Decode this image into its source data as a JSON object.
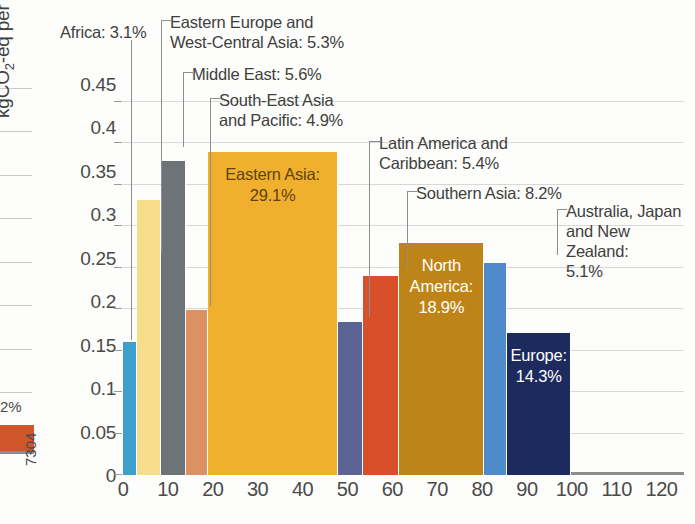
{
  "chart_data": {
    "type": "bar",
    "title": "",
    "subtitle": "",
    "xlabel": "",
    "ylabel": "kgCO2-eq per USD GDPPPP",
    "ylabel_parts": {
      "prefix": "kgCO",
      "sub": "2",
      "mid": "-eq per USD GDP",
      "sup": "PPP"
    },
    "xlim": [
      0,
      125
    ],
    "ylim": [
      0,
      0.47
    ],
    "grid": true,
    "legend_position": "none",
    "note": "Marimekko-style variable-width bars: bar width = share of world population (%), bar height = emissions intensity",
    "yticks": [
      "0",
      "0.05",
      "0.1",
      "0.15",
      "0.2",
      "0.25",
      "0.3",
      "0.35",
      "0.4",
      "0.45"
    ],
    "ytick_values": [
      0,
      0.05,
      0.1,
      0.15,
      0.2,
      0.25,
      0.3,
      0.35,
      0.4,
      0.45
    ],
    "xticks": [
      "0",
      "10",
      "20",
      "30",
      "40",
      "50",
      "60",
      "70",
      "80",
      "90",
      "100",
      "110",
      "120"
    ],
    "xtick_values": [
      0,
      10,
      20,
      30,
      40,
      50,
      60,
      70,
      80,
      90,
      100,
      110,
      120
    ],
    "categories": [
      "Africa",
      "Eastern Europe and West-Central Asia",
      "Middle East",
      "South-East Asia and Pacific",
      "Eastern Asia",
      "Latin America and Caribbean",
      "Southern Asia",
      "North America",
      "Australia, Japan and New Zealand",
      "Europe"
    ],
    "widths_percent": [
      3.1,
      5.3,
      5.6,
      4.9,
      29.1,
      5.4,
      8.2,
      18.9,
      5.1,
      14.3
    ],
    "values": [
      0.16,
      0.332,
      0.378,
      0.199,
      0.389,
      0.184,
      0.24,
      0.28,
      0.256,
      0.171
    ],
    "series": [
      {
        "name": "Emissions intensity",
        "values": [
          0.16,
          0.332,
          0.378,
          0.199,
          0.389,
          0.184,
          0.24,
          0.28,
          0.256,
          0.171
        ]
      }
    ],
    "colors": [
      "#3e9fcd",
      "#f5dd8a",
      "#6d7478",
      "#dd9163",
      "#f0b02e",
      "#5c6494",
      "#d8502a",
      "#bf8418",
      "#4f8bc9",
      "#1d2a5e"
    ]
  },
  "bars": [
    {
      "label": "Africa",
      "percent": "3.1%",
      "color": "#3e9fcd",
      "value": 0.16,
      "x0": 0.0,
      "x1": 3.1,
      "inner": false,
      "inner_text": ""
    },
    {
      "label": "Eastern Europe and West-Central Asia",
      "percent": "5.3%",
      "color": "#f5dd8a",
      "value": 0.332,
      "x0": 3.1,
      "x1": 8.4,
      "inner": false,
      "inner_text": ""
    },
    {
      "label": "Middle East",
      "percent": "5.6%",
      "color": "#6d7478",
      "value": 0.378,
      "x0": 8.4,
      "x1": 14.0,
      "inner": false,
      "inner_text": ""
    },
    {
      "label": "South-East Asia and Pacific",
      "percent": "4.9%",
      "color": "#dd9163",
      "value": 0.199,
      "x0": 14.0,
      "x1": 18.9,
      "inner": false,
      "inner_text": ""
    },
    {
      "label": "Eastern Asia",
      "percent": "29.1%",
      "color": "#f0b02e",
      "value": 0.389,
      "x0": 18.9,
      "x1": 48.0,
      "inner": true,
      "inner_text": "Eastern Asia:\n29.1%",
      "inner_color": "#5c4310"
    },
    {
      "label": "Latin America and Caribbean",
      "percent": "5.4%",
      "color": "#5c6494",
      "value": 0.184,
      "x0": 48.0,
      "x1": 53.4,
      "inner": false,
      "inner_text": ""
    },
    {
      "label": "Southern Asia",
      "percent": "8.2%",
      "color": "#d8502a",
      "value": 0.24,
      "x0": 53.4,
      "x1": 61.6,
      "inner": false,
      "inner_text": ""
    },
    {
      "label": "North America",
      "percent": "18.9%",
      "color": "#bf8418",
      "value": 0.28,
      "x0": 61.6,
      "x1": 80.5,
      "inner": true,
      "inner_text": "North\nAmerica:\n18.9%",
      "inner_color": "#ffffff"
    },
    {
      "label": "Australia, Japan and New Zealand",
      "percent": "5.1%",
      "color": "#4f8bc9",
      "value": 0.256,
      "x0": 80.5,
      "x1": 85.6,
      "inner": false,
      "inner_text": ""
    },
    {
      "label": "Europe",
      "percent": "14.3%",
      "color": "#1d2a5e",
      "value": 0.171,
      "x0": 85.6,
      "x1": 99.9,
      "inner": true,
      "inner_text": "Europe: 14.3%",
      "inner_color": "#ffffff"
    }
  ],
  "callouts": [
    {
      "id": "africa",
      "text": "Africa: 3.1%"
    },
    {
      "id": "eeca",
      "text": "Eastern Europe and\nWest-Central Asia: 5.3%"
    },
    {
      "id": "middle-east",
      "text": "Middle East: 5.6%"
    },
    {
      "id": "sea-pacific",
      "text": "South-East Asia\nand Pacific: 4.9%"
    },
    {
      "id": "latam",
      "text": "Latin America and\nCaribbean: 5.4%"
    },
    {
      "id": "southern-asia",
      "text": "Southern Asia: 8.2%"
    },
    {
      "id": "ajnz",
      "text": "Australia, Japan\nand New Zealand:\n5.1%"
    }
  ],
  "left_fragment": {
    "percent_text": "2%",
    "rotated_text": "7304",
    "swatch_color": "#d0562a"
  }
}
